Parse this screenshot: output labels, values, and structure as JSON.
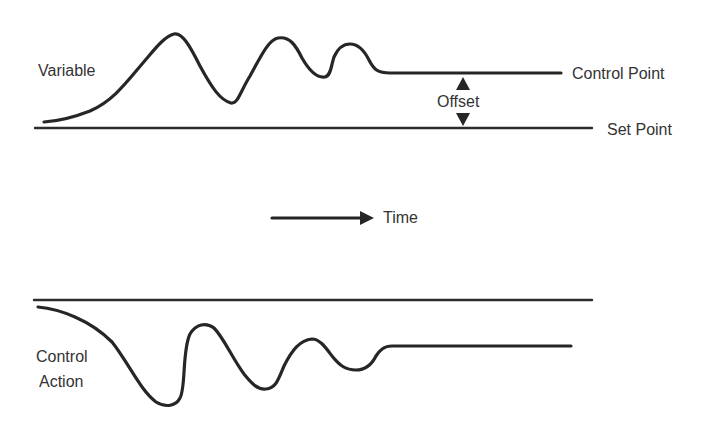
{
  "diagram": {
    "title": "",
    "labels": {
      "variable": "Variable",
      "control_point": "Control Point",
      "offset": "Offset",
      "set_point": "Set Point",
      "time": "Time",
      "control_action_line1": "Control",
      "control_action_line2": "Action"
    },
    "colors": {
      "stroke": "#262626",
      "text": "#333333",
      "background": "#ffffff"
    },
    "elements": [
      {
        "id": "variable-curve",
        "type": "curve",
        "description": "Damped oscillation of process variable settling at control point"
      },
      {
        "id": "control-point-line",
        "type": "level",
        "description": "Steady state value reached by variable"
      },
      {
        "id": "set-point-line",
        "type": "level",
        "description": "Desired value"
      },
      {
        "id": "offset-indicator",
        "type": "double-arrow",
        "description": "Difference between control point and set point"
      },
      {
        "id": "time-arrow",
        "type": "arrow",
        "description": "Direction of time"
      },
      {
        "id": "control-action-reference-line",
        "type": "level"
      },
      {
        "id": "control-action-curve",
        "type": "curve",
        "description": "Damped oscillation of controller output settling to new level"
      }
    ]
  }
}
